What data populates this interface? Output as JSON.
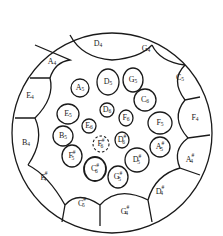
{
  "diagram": {
    "type": "steelpan-note-layout",
    "outer_ring": [
      {
        "id": "d4",
        "note": "D",
        "accidental": "",
        "octave": "4"
      },
      {
        "id": "g4",
        "note": "G",
        "accidental": "",
        "octave": "4"
      },
      {
        "id": "c5",
        "note": "C",
        "accidental": "",
        "octave": "5"
      },
      {
        "id": "f4",
        "note": "F",
        "accidental": "",
        "octave": "4"
      },
      {
        "id": "as4",
        "note": "A",
        "accidental": "#",
        "octave": "4"
      },
      {
        "id": "ds4",
        "note": "D",
        "accidental": "#",
        "octave": "4"
      },
      {
        "id": "gs4",
        "note": "G",
        "accidental": "#",
        "octave": "4"
      },
      {
        "id": "cs5",
        "note": "C",
        "accidental": "#",
        "octave": "5",
        "note_on_reading": "subscript not clearly legible; may be 4"
      },
      {
        "id": "fs4",
        "note": "F",
        "accidental": "#",
        "octave": "4"
      },
      {
        "id": "b4",
        "note": "B",
        "accidental": "",
        "octave": "4"
      },
      {
        "id": "e4",
        "note": "E",
        "accidental": "",
        "octave": "4"
      },
      {
        "id": "a4",
        "note": "A",
        "accidental": "",
        "octave": "4"
      }
    ],
    "middle_ring": [
      {
        "id": "d5",
        "note": "D",
        "accidental": "",
        "octave": "5"
      },
      {
        "id": "g5",
        "note": "G",
        "accidental": "",
        "octave": "5"
      },
      {
        "id": "c6",
        "note": "C",
        "accidental": "",
        "octave": "6"
      },
      {
        "id": "f5",
        "note": "F",
        "accidental": "",
        "octave": "5"
      },
      {
        "id": "as5",
        "note": "A",
        "accidental": "#",
        "octave": "5"
      },
      {
        "id": "ds5",
        "note": "D",
        "accidental": "#",
        "octave": "5"
      },
      {
        "id": "gs5",
        "note": "G",
        "accidental": "#",
        "octave": "5"
      },
      {
        "id": "cs6",
        "note": "C",
        "accidental": "#",
        "octave": "6"
      },
      {
        "id": "fs5",
        "note": "F",
        "accidental": "#",
        "octave": "5"
      },
      {
        "id": "b5",
        "note": "B",
        "accidental": "",
        "octave": "5"
      },
      {
        "id": "e5",
        "note": "E",
        "accidental": "",
        "octave": "5"
      },
      {
        "id": "a5",
        "note": "A",
        "accidental": "",
        "octave": "5"
      }
    ],
    "inner_ring": [
      {
        "id": "d6",
        "note": "D",
        "accidental": "",
        "octave": "6"
      },
      {
        "id": "f6",
        "note": "F",
        "accidental": "",
        "octave": "6"
      },
      {
        "id": "ds6",
        "note": "D",
        "accidental": "#",
        "octave": "6"
      },
      {
        "id": "e6",
        "note": "E",
        "accidental": "",
        "octave": "6"
      }
    ],
    "center": {
      "id": "fs6",
      "note": "F",
      "accidental": "#",
      "octave": "6",
      "style": "dashed"
    }
  }
}
